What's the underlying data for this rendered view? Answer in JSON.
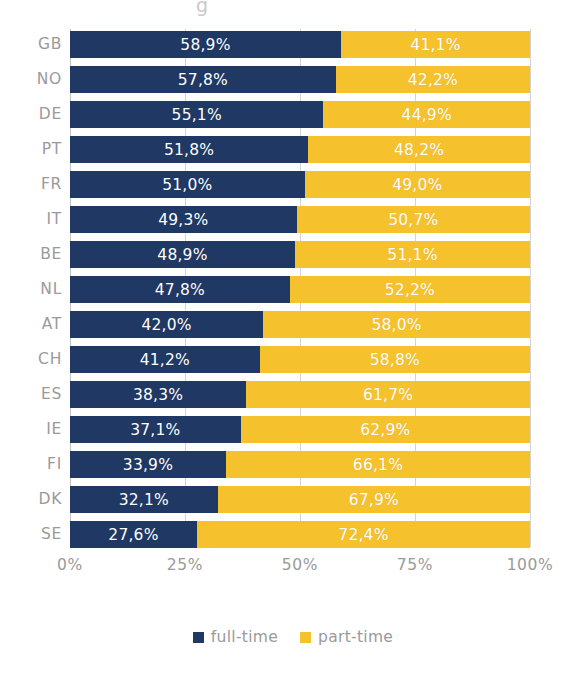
{
  "artifact": {
    "top_fragment": "g"
  },
  "chart_data": {
    "type": "bar",
    "subtype": "stacked-horizontal-100pct",
    "title": "",
    "subtitle": "",
    "xlabel": "",
    "ylabel": "",
    "xlim": [
      0,
      100
    ],
    "grid": true,
    "legend_position": "bottom",
    "orientation": "horizontal",
    "decimal_separator": ",",
    "categories": [
      "GB",
      "NO",
      "DE",
      "PT",
      "FR",
      "IT",
      "BE",
      "NL",
      "AT",
      "CH",
      "ES",
      "IE",
      "FI",
      "DK",
      "SE"
    ],
    "tick_labels": [
      "0%",
      "25%",
      "50%",
      "75%",
      "100%"
    ],
    "tick_values": [
      0,
      25,
      50,
      75,
      100
    ],
    "series": [
      {
        "name": "full-time",
        "color": "#1f3864",
        "values": [
          58.9,
          57.8,
          55.1,
          51.8,
          51.0,
          49.3,
          48.9,
          47.8,
          42.0,
          41.2,
          38.3,
          37.1,
          33.9,
          32.1,
          27.6
        ],
        "labels": [
          "58,9%",
          "57,8%",
          "55,1%",
          "51,8%",
          "51,0%",
          "49,3%",
          "48,9%",
          "47,8%",
          "42,0%",
          "41,2%",
          "38,3%",
          "37,1%",
          "33,9%",
          "32,1%",
          "27,6%"
        ]
      },
      {
        "name": "part-time",
        "color": "#f5c22e",
        "values": [
          41.1,
          42.2,
          44.9,
          48.2,
          49.0,
          50.7,
          51.1,
          52.2,
          58.0,
          58.8,
          61.7,
          62.9,
          66.1,
          67.9,
          72.4
        ],
        "labels": [
          "41,1%",
          "42,2%",
          "44,9%",
          "48,2%",
          "49,0%",
          "50,7%",
          "51,1%",
          "52,2%",
          "58,0%",
          "58,8%",
          "61,7%",
          "62,9%",
          "66,1%",
          "67,9%",
          "72,4%"
        ]
      }
    ]
  },
  "legend": {
    "items": [
      {
        "label": "full-time",
        "color": "#1f3864"
      },
      {
        "label": "part-time",
        "color": "#f5c22e"
      }
    ]
  },
  "colors": {
    "full_time": "#1f3864",
    "part_time": "#f5c22e",
    "axis_text": "#9a9a9a",
    "gridline": "#d4d4d4",
    "background": "#ffffff",
    "bar_label_text": "#ffffff"
  }
}
